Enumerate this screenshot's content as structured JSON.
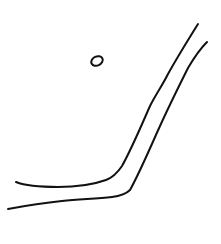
{
  "sketch": {
    "description": "Hand-drawn line sketch: two roughly parallel strokes bending from horizontal to a steep diagonal, with a small oval above-left",
    "background_color": "#ffffff",
    "ink_color": "#111111",
    "stroke_width": 2,
    "elements": [
      {
        "name": "inner-curve-stroke",
        "path": "M16,182 C26,186 40,187 58,187 C76,187 92,185 106,180 C114,177 118,172 122,166 C132,148 142,124 150,106 C156,94 162,86 168,74 C178,56 188,40 198,24"
      },
      {
        "name": "outer-curve-stroke",
        "path": "M8,209 C24,206 42,203 62,201 C80,199 96,199 112,197 C120,196 126,194 130,190 C140,172 150,148 160,126 C170,104 180,84 188,68 C195,56 201,48 207,42"
      },
      {
        "name": "small-oval",
        "cx": 97,
        "cy": 61,
        "rx": 6,
        "ry": 4.5,
        "rotate": -25
      }
    ]
  }
}
